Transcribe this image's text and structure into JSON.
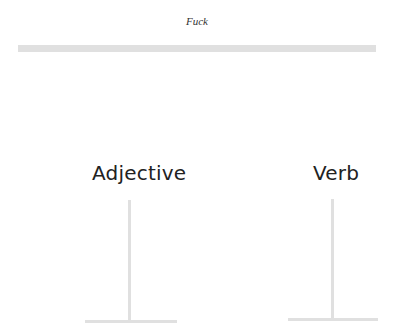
{
  "header": {
    "title": "Fuck"
  },
  "columns": [
    {
      "label": "Adjective"
    },
    {
      "label": "Verb"
    }
  ],
  "colors": {
    "line": "#e0e0e0",
    "text": "#222222",
    "background": "#ffffff"
  }
}
